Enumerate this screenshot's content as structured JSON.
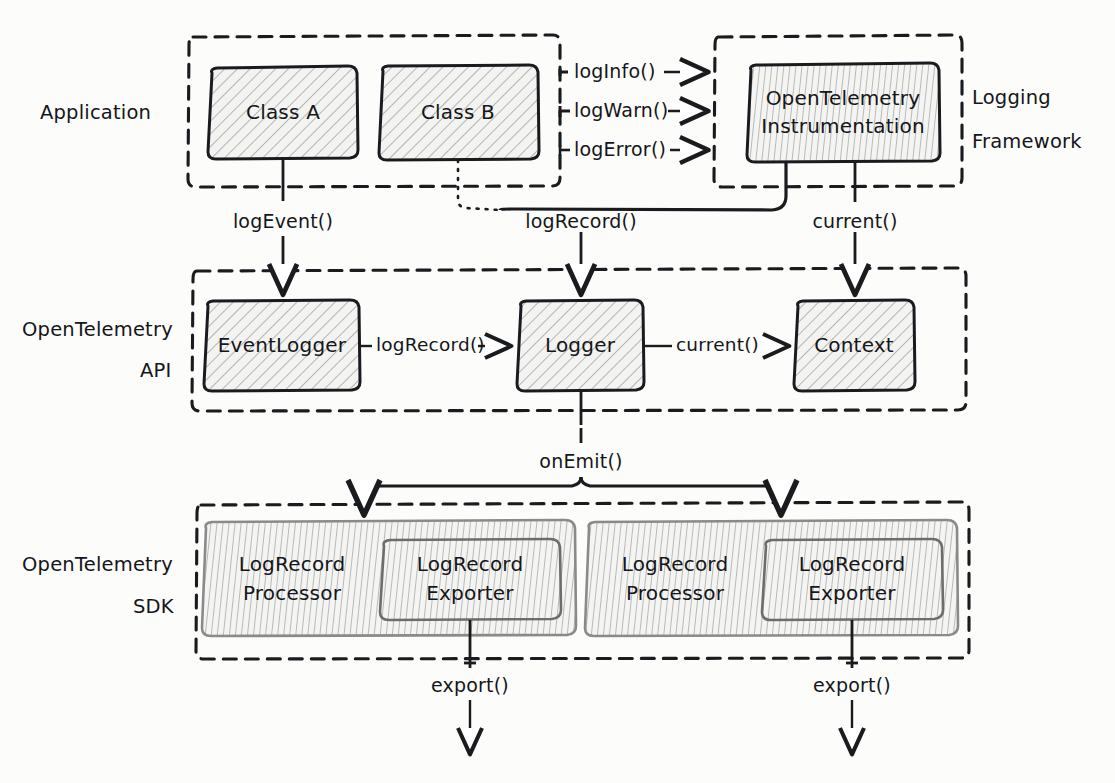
{
  "diagram": {
    "style": "hand-drawn sketch",
    "background_color": "#fcfcfa",
    "ink_color": "#1a1b1f"
  },
  "containers": [
    {
      "id": "application",
      "label": "Application",
      "label_side": "left"
    },
    {
      "id": "logging_framework",
      "label_line1": "Logging",
      "label_line2": "Framework",
      "label_side": "right"
    },
    {
      "id": "otel_api",
      "label_line1": "OpenTelemetry",
      "label_line2": "API",
      "label_side": "left"
    },
    {
      "id": "otel_sdk",
      "label_line1": "OpenTelemetry",
      "label_line2": "SDK",
      "label_side": "left"
    }
  ],
  "boxes": {
    "class_a": "Class A",
    "class_b": "Class B",
    "otel_instrumentation_line1": "OpenTelemetry",
    "otel_instrumentation_line2": "Instrumentation",
    "event_logger": "EventLogger",
    "logger": "Logger",
    "context": "Context",
    "processor_left_line1": "LogRecord",
    "processor_left_line2": "Processor",
    "exporter_left_line1": "LogRecord",
    "exporter_left_line2": "Exporter",
    "processor_right_line1": "LogRecord",
    "processor_right_line2": "Processor",
    "exporter_right_line1": "LogRecord",
    "exporter_right_line2": "Exporter"
  },
  "edge_labels": {
    "log_info": "logInfo()",
    "log_warn": "logWarn()",
    "log_error": "logError()",
    "log_event": "logEvent()",
    "log_record_from_instrumentation": "logRecord()",
    "current_from_instrumentation": "current()",
    "log_record_api": "logRecord()",
    "current_api": "current()",
    "on_emit": "onEmit()",
    "export_left": "export()",
    "export_right": "export()"
  }
}
